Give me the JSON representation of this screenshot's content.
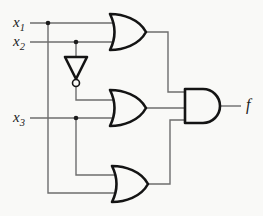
{
  "diagram": {
    "type": "logic-circuit",
    "expression": "f = (x1 + x2) AND (NOT x2 + x3) AND (x3 + x1)",
    "inputs": [
      "x1",
      "x2",
      "x3"
    ],
    "output": "f",
    "gates": [
      {
        "id": "or-top",
        "type": "OR",
        "inputs": [
          "x1",
          "x2"
        ]
      },
      {
        "id": "not",
        "type": "NOT",
        "inputs": [
          "x2"
        ]
      },
      {
        "id": "or-middle",
        "type": "OR",
        "inputs": [
          "not.out",
          "x3"
        ]
      },
      {
        "id": "or-bottom",
        "type": "OR",
        "inputs": [
          "x3",
          "x1"
        ]
      },
      {
        "id": "and-out",
        "type": "AND",
        "inputs": [
          "or-top.out",
          "or-middle.out",
          "or-bottom.out"
        ],
        "output": "f"
      }
    ]
  },
  "labels": {
    "x1": {
      "base": "x",
      "sub": "1"
    },
    "x2": {
      "base": "x",
      "sub": "2"
    },
    "x3": {
      "base": "x",
      "sub": "3"
    },
    "f": "f"
  },
  "colors": {
    "background": "#f9f9f7",
    "wire": "#6e6e6e",
    "gate_outline": "#141414",
    "label": "#1c1c1c"
  }
}
